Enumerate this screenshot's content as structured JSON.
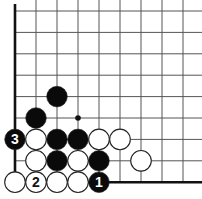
{
  "diagram": {
    "type": "go-board-fragment",
    "grid": {
      "columns": 9,
      "rows": 9,
      "origin_x": 15,
      "origin_y": 11,
      "spacing_x": 21,
      "spacing_y": 21.4,
      "line_color": "#555555",
      "edge_color": "#111111",
      "edges": [
        "left",
        "bottom"
      ]
    },
    "star_points": [
      {
        "col": 3,
        "row": 5
      }
    ],
    "stones": [
      {
        "col": 2,
        "row": 4,
        "color": "black",
        "label": ""
      },
      {
        "col": 1,
        "row": 5,
        "color": "black",
        "label": ""
      },
      {
        "col": 0,
        "row": 6,
        "color": "black",
        "label": "3"
      },
      {
        "col": 1,
        "row": 6,
        "color": "white",
        "label": ""
      },
      {
        "col": 2,
        "row": 6,
        "color": "black",
        "label": ""
      },
      {
        "col": 3,
        "row": 6,
        "color": "black",
        "label": ""
      },
      {
        "col": 4,
        "row": 6,
        "color": "white",
        "label": ""
      },
      {
        "col": 5,
        "row": 6,
        "color": "white",
        "label": ""
      },
      {
        "col": 1,
        "row": 7,
        "color": "white",
        "label": ""
      },
      {
        "col": 2,
        "row": 7,
        "color": "black",
        "label": ""
      },
      {
        "col": 3,
        "row": 7,
        "color": "white",
        "label": ""
      },
      {
        "col": 4,
        "row": 7,
        "color": "black",
        "label": ""
      },
      {
        "col": 6,
        "row": 7,
        "color": "white",
        "label": ""
      },
      {
        "col": 0,
        "row": 8,
        "color": "white",
        "label": ""
      },
      {
        "col": 1,
        "row": 8,
        "color": "white",
        "label": "2"
      },
      {
        "col": 2,
        "row": 8,
        "color": "white",
        "label": ""
      },
      {
        "col": 3,
        "row": 8,
        "color": "white",
        "label": ""
      },
      {
        "col": 4,
        "row": 8,
        "color": "black",
        "label": "1"
      }
    ],
    "colors": {
      "black_stone": "#0a0a0a",
      "white_stone": "#ffffff",
      "stone_outline": "#222222",
      "black_label": "#ffffff",
      "white_label": "#111111"
    }
  }
}
